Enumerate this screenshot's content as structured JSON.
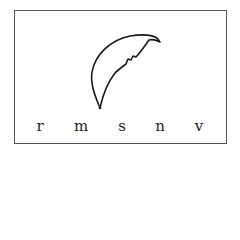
{
  "diagram": {
    "title": "",
    "shape": "crescent",
    "stroke_color": "#1a1a1a",
    "border_color": "#555555",
    "letters": [
      {
        "label": "r",
        "x": 40
      },
      {
        "label": "m",
        "x": 81
      },
      {
        "label": "s",
        "x": 122
      },
      {
        "label": "n",
        "x": 160
      },
      {
        "label": "v",
        "x": 199
      }
    ]
  }
}
